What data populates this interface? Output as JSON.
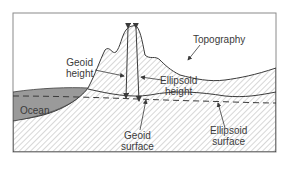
{
  "diagram": {
    "labels": {
      "geoid_height_1": "Geoid",
      "geoid_height_2": "height",
      "topography": "Topography",
      "ellipsoid_height_1": "Ellipsoid",
      "ellipsoid_height_2": "height",
      "ocean": "Ocean",
      "geoid_surface_1": "Geoid",
      "geoid_surface_2": "surface",
      "ellipsoid_surface_1": "Ellipsoid",
      "ellipsoid_surface_2": "surface"
    },
    "colors": {
      "frame": "#8a8a8a",
      "line": "#3a3a3a",
      "hatch": "#b0b0b0",
      "ocean": "#9a9a9a"
    }
  }
}
